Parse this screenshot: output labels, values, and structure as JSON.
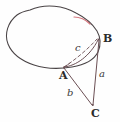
{
  "figure": {
    "canvas": {
      "width": 120,
      "height": 122,
      "background": "#fefefe"
    },
    "colors": {
      "outline": "#4a4446",
      "highlight": "#d4787f",
      "segment": "#6b4f54",
      "dashed": "#6b4f54",
      "label": "#2b2b2b"
    },
    "points": [
      {
        "id": "A",
        "label": "A",
        "x": 64,
        "y": 67
      },
      {
        "id": "B",
        "label": "B",
        "x": 99,
        "y": 39
      },
      {
        "id": "C",
        "label": "C",
        "x": 93,
        "y": 106
      }
    ],
    "sides": [
      {
        "id": "a",
        "label": "a",
        "from": "B",
        "to": "C",
        "style": "solid"
      },
      {
        "id": "b",
        "label": "b",
        "from": "A",
        "to": "C",
        "style": "solid"
      },
      {
        "id": "c",
        "label": "c",
        "from": "A",
        "to": "B",
        "style": "dashed"
      }
    ],
    "arcs": [
      {
        "id": "arc-AB",
        "from": "A",
        "to": "B",
        "style": "solid",
        "note": "curved arc bulging downward from A to B"
      }
    ],
    "highlight": {
      "id": "red-arc-segment",
      "color": "#d4787f",
      "note": "short red segment on upper-right of closed curve"
    },
    "outline_note": "irregular closed blob curve (oval/egg shaped)"
  }
}
